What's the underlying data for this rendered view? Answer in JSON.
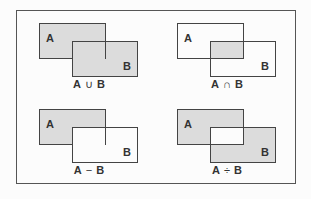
{
  "diagram": {
    "panels": [
      {
        "id": "union",
        "set_a": "A",
        "set_b": "B",
        "operator": "∪",
        "caption_left": "A",
        "caption_right": "B",
        "fillA": true,
        "fillB": true,
        "fillOverlap": true
      },
      {
        "id": "intersection",
        "set_a": "A",
        "set_b": "B",
        "operator": "∩",
        "caption_left": "A",
        "caption_right": "B",
        "fillA": false,
        "fillB": false,
        "fillOverlap": true
      },
      {
        "id": "difference",
        "set_a": "A",
        "set_b": "B",
        "operator": "−",
        "caption_left": "A",
        "caption_right": "B",
        "fillA": true,
        "fillB": false,
        "fillOverlap": false
      },
      {
        "id": "symmetric-difference",
        "set_a": "A",
        "set_b": "B",
        "operator": "÷",
        "caption_left": "A",
        "caption_right": "B",
        "fillA": true,
        "fillB": true,
        "fillOverlap": false
      }
    ],
    "colors": {
      "fill": "#dcdcdc",
      "stroke": "#444444",
      "background": "#fcfcfc"
    }
  }
}
